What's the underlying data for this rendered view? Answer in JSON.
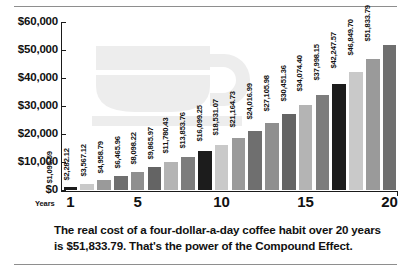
{
  "chart_data": {
    "type": "bar",
    "title": "",
    "xlabel": "Years",
    "ylabel": "",
    "ylim": [
      0,
      60000
    ],
    "grid": false,
    "legend": "none",
    "y_ticks": [
      "$0",
      "$10,000",
      "$20,000",
      "$30,000",
      "$40,000",
      "$50,000",
      "$60,000"
    ],
    "y_tick_values": [
      0,
      10000,
      20000,
      30000,
      40000,
      50000,
      60000
    ],
    "x_ticks": [
      "1",
      "5",
      "10",
      "15",
      "20"
    ],
    "x_tick_values": [
      1,
      5,
      10,
      15,
      20
    ],
    "categories": [
      1,
      2,
      3,
      4,
      5,
      6,
      7,
      8,
      9,
      10,
      11,
      12,
      13,
      14,
      15,
      16,
      17,
      18,
      19,
      20
    ],
    "values": [
      1095.59,
      2282.12,
      3567.12,
      4958.79,
      6465.96,
      8098.22,
      9865.97,
      11780.43,
      13853.76,
      16099.25,
      18531.07,
      21164.73,
      24016.99,
      27105.98,
      30451.36,
      34074.4,
      37998.15,
      42247.57,
      46849.7,
      51833.79
    ],
    "data_labels": [
      "$1,095.59",
      "$2,282.12",
      "$3,567.12",
      "$4,958.79",
      "$6,465.96",
      "$8,098.22",
      "$9,865.97",
      "$11,780.43",
      "$13,853.76",
      "$16,099.25",
      "$18,531.07",
      "$21,164.73",
      "$24,016.99",
      "$27,105.98",
      "$30,451.36",
      "$34,074.40",
      "$37,998.15",
      "$42,247.57",
      "$46,849.70",
      "$51,833.79"
    ],
    "bar_colors": [
      "#1c1c1c",
      "#c9c9c9",
      "#9a9a9a",
      "#6f6f6f",
      "#8f8f8f",
      "#646464",
      "#b4b4b4",
      "#7d7d7d",
      "#1c1c1c",
      "#c9c9c9",
      "#9a9a9a",
      "#6f6f6f",
      "#8f8f8f",
      "#646464",
      "#b4b4b4",
      "#7d7d7d",
      "#1c1c1c",
      "#c9c9c9",
      "#9a9a9a",
      "#6f6f6f"
    ],
    "axis_color": "#1a1a1a",
    "watermark": "coffee-cup",
    "watermark_color": "#ededed"
  },
  "caption": {
    "text": "The real cost of a four-dollar-a-day coffee habit over 20 years is $51,833.79. That's the power of the Compound Effect."
  },
  "xaxis_caption": "Years"
}
